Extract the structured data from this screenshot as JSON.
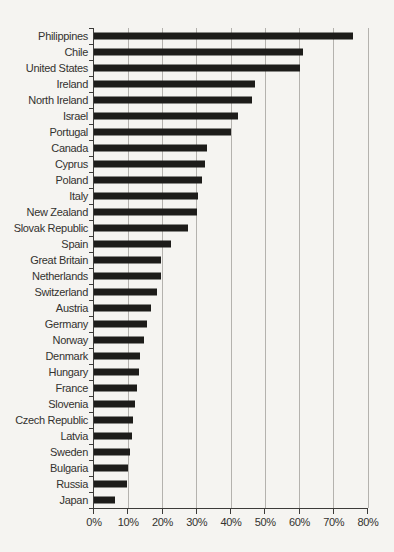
{
  "page": {
    "background": "#f5f4f1"
  },
  "chart_data": {
    "type": "bar",
    "orientation": "horizontal",
    "title": "",
    "xlabel": "",
    "ylabel": "",
    "xlim": [
      0,
      80
    ],
    "grid": true,
    "x_ticks": [
      "0%",
      "10%",
      "20%",
      "30%",
      "40%",
      "50%",
      "60%",
      "70%",
      "80%"
    ],
    "categories": [
      "Philippines",
      "Chile",
      "United States",
      "Ireland",
      "North Ireland",
      "Israel",
      "Portugal",
      "Canada",
      "Cyprus",
      "Poland",
      "Italy",
      "New Zealand",
      "Slovak Republic",
      "Spain",
      "Great Britain",
      "Netherlands",
      "Switzerland",
      "Austria",
      "Germany",
      "Norway",
      "Denmark",
      "Hungary",
      "France",
      "Slovenia",
      "Czech Republic",
      "Latvia",
      "Sweden",
      "Bulgaria",
      "Russia",
      "Japan"
    ],
    "values": [
      75.5,
      61,
      60,
      47,
      46,
      42,
      40,
      33,
      32.5,
      31.5,
      30.5,
      30,
      27.5,
      22.5,
      19.5,
      19.5,
      18.5,
      16.5,
      15.5,
      14.5,
      13.5,
      13,
      12.5,
      12,
      11.5,
      11,
      10.5,
      10,
      9.5,
      6
    ],
    "colors": {
      "bar": "#1d1c1a",
      "gridline": "#b4b2ae",
      "axis": "#3c3b39",
      "label": "#33322f"
    }
  }
}
